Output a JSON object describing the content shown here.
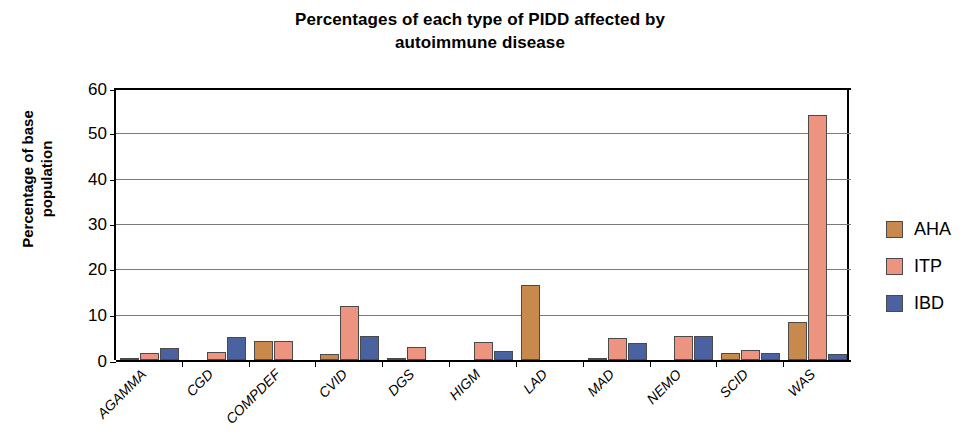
{
  "chart_data": {
    "type": "bar",
    "title": "Percentages of each type of PIDD affected by autoimmune disease",
    "title_line1": "Percentages of each type of PIDD affected by",
    "title_line2": "autoimmune disease",
    "xlabel": "",
    "ylabel": "Percentage of base population",
    "ylabel_line1": "Percentage of base",
    "ylabel_line2": "population",
    "ylim": [
      0,
      60
    ],
    "yticks": [
      0,
      10,
      20,
      30,
      40,
      50,
      60
    ],
    "grid": true,
    "legend_position": "right",
    "categories": [
      "AGAMMA",
      "CGD",
      "COMPDEF",
      "CVID",
      "DGS",
      "HIGM",
      "LAD",
      "MAD",
      "NEMO",
      "SCID",
      "WAS"
    ],
    "series": [
      {
        "name": "AHA",
        "color": "#C8894D",
        "values": [
          0.3,
          0,
          4.1,
          1.3,
          0.4,
          0,
          16.5,
          0.4,
          0,
          1.5,
          8.3
        ]
      },
      {
        "name": "ITP",
        "color": "#ED9480",
        "values": [
          1.5,
          1.7,
          4.1,
          12.0,
          2.8,
          3.9,
          0,
          4.8,
          5.4,
          2.1,
          54.0
        ]
      },
      {
        "name": "IBD",
        "color": "#4A63A0",
        "values": [
          2.7,
          5.0,
          0,
          5.3,
          0,
          1.9,
          0,
          3.8,
          5.4,
          1.5,
          1.3
        ]
      }
    ]
  }
}
